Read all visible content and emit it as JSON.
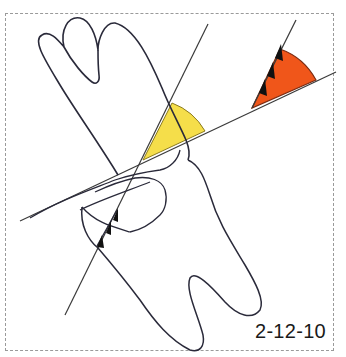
{
  "figure": {
    "label": "2-12-10",
    "colors": {
      "outline": "#2a2a3a",
      "line": "#3a3a3a",
      "yellow_sector": "#f5de4a",
      "orange_sector": "#f0561a",
      "frame": "#9a9a9a"
    },
    "elements": [
      {
        "name": "tooth-outline",
        "description": "Tooth with three crown cusps at top and two roots at bottom"
      },
      {
        "name": "tooth-axis-line",
        "description": "Long axis line through tooth"
      },
      {
        "name": "reference-line",
        "description": "Oblique reference line crossing tooth"
      },
      {
        "name": "yellow-angle-sector",
        "description": "Angle between tooth axis and reference line"
      },
      {
        "name": "orange-angle-sector",
        "description": "Projected angle with X-ray beam direction arrows"
      },
      {
        "name": "beam-arrows",
        "description": "Triple arrowheads indicating beam direction"
      }
    ]
  }
}
